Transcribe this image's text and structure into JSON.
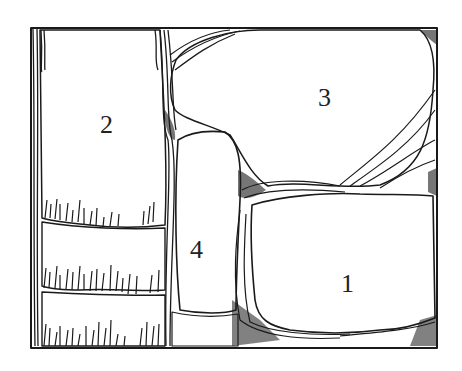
{
  "figure": {
    "type": "line-art diagram of stone wall with vegetation/mortar between stones",
    "regions": [
      {
        "id": "stone-1",
        "label": "1"
      },
      {
        "id": "stone-2",
        "label": "2"
      },
      {
        "id": "stone-3",
        "label": "3"
      },
      {
        "id": "stone-4",
        "label": "4"
      }
    ],
    "colors": {
      "ink": "#1a1a1a",
      "paper": "#ffffff"
    }
  }
}
